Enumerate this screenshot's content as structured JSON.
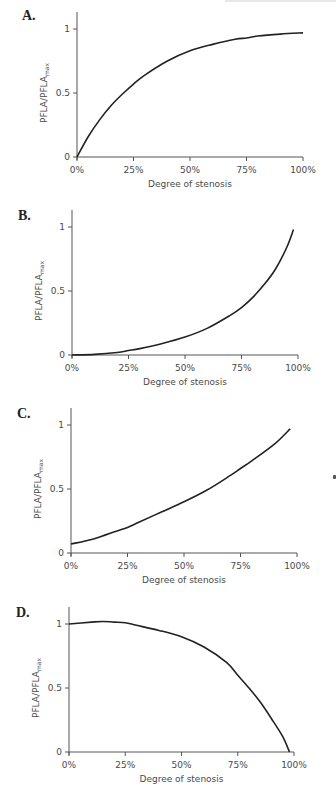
{
  "chart_data": [
    {
      "id": "A",
      "panel_label": "A.",
      "type": "line",
      "title": "",
      "xlabel": "Degree of stenosis",
      "ylabel": "PFLA/PFLA",
      "ylabel_sub": "max",
      "x_ticks": [
        "0%",
        "25%",
        "50%",
        "75%",
        "100%"
      ],
      "y_ticks": [
        "0",
        "0.5",
        "1"
      ],
      "xlim": [
        0,
        100
      ],
      "ylim": [
        0,
        1.15
      ],
      "grid": false,
      "x": [
        0,
        5,
        10,
        15,
        20,
        25,
        30,
        40,
        50,
        60,
        70,
        75,
        80,
        90,
        100
      ],
      "values": [
        0,
        0.16,
        0.29,
        0.4,
        0.49,
        0.57,
        0.64,
        0.75,
        0.83,
        0.88,
        0.92,
        0.93,
        0.945,
        0.96,
        0.97
      ]
    },
    {
      "id": "B",
      "panel_label": "B.",
      "type": "line",
      "title": "",
      "xlabel": "Degree of stenosis",
      "ylabel": "PFLA/PFLA",
      "ylabel_sub": "max",
      "x_ticks": [
        "0%",
        "25%",
        "50%",
        "75%",
        "100%"
      ],
      "y_ticks": [
        "0",
        "0.5",
        "1"
      ],
      "xlim": [
        0,
        100
      ],
      "ylim": [
        0,
        1.15
      ],
      "grid": false,
      "x": [
        0,
        10,
        20,
        25,
        30,
        40,
        50,
        60,
        70,
        75,
        80,
        85,
        90,
        95,
        98
      ],
      "values": [
        0,
        0.005,
        0.02,
        0.035,
        0.05,
        0.09,
        0.14,
        0.21,
        0.31,
        0.37,
        0.45,
        0.55,
        0.67,
        0.84,
        0.98
      ]
    },
    {
      "id": "C",
      "panel_label": "C.",
      "type": "line",
      "title": "",
      "xlabel": "Degree of stenosis",
      "ylabel": "PFLA/PFLA",
      "ylabel_sub": "max",
      "x_ticks": [
        "0%",
        "25%",
        "50%",
        "75%",
        "100%"
      ],
      "y_ticks": [
        "0",
        "0.5",
        "1"
      ],
      "xlim": [
        0,
        100
      ],
      "ylim": [
        0,
        1.15
      ],
      "grid": false,
      "x": [
        0,
        10,
        20,
        25,
        30,
        40,
        50,
        60,
        70,
        75,
        80,
        90,
        97
      ],
      "values": [
        0.07,
        0.11,
        0.17,
        0.2,
        0.24,
        0.32,
        0.4,
        0.49,
        0.6,
        0.66,
        0.72,
        0.85,
        0.97
      ]
    },
    {
      "id": "D",
      "panel_label": "D.",
      "type": "line",
      "title": "",
      "xlabel": "Degree of stenosis",
      "ylabel": "PFLA/PFLA",
      "ylabel_sub": "max",
      "x_ticks": [
        "0%",
        "25%",
        "50%",
        "75%",
        "100%"
      ],
      "y_ticks": [
        "0",
        "0.5",
        "1"
      ],
      "xlim": [
        0,
        100
      ],
      "ylim": [
        0,
        1.15
      ],
      "grid": false,
      "x": [
        0,
        10,
        15,
        20,
        25,
        30,
        40,
        50,
        60,
        70,
        75,
        80,
        85,
        90,
        95,
        98
      ],
      "values": [
        1.0,
        1.015,
        1.02,
        1.015,
        1.01,
        0.99,
        0.95,
        0.9,
        0.82,
        0.7,
        0.6,
        0.5,
        0.39,
        0.26,
        0.12,
        0.0
      ]
    }
  ],
  "layout": [
    {
      "top": 0,
      "letter_x": 22,
      "letter_y": 8,
      "ax_x0": 77,
      "ax_x1": 303,
      "ax_y0": 157,
      "ax_y1": 29,
      "ax_top": 12
    },
    {
      "top": 0,
      "letter_x": 18,
      "letter_y": 208,
      "ax_x0": 72,
      "ax_x1": 298,
      "ax_y0": 355,
      "ax_y1": 227,
      "ax_top": 210
    },
    {
      "top": 0,
      "letter_x": 17,
      "letter_y": 406,
      "ax_x0": 71,
      "ax_x1": 297,
      "ax_y0": 553,
      "ax_y1": 425,
      "ax_top": 408
    },
    {
      "top": 0,
      "letter_x": 16,
      "letter_y": 605,
      "ax_x0": 69,
      "ax_x1": 294,
      "ax_y0": 752,
      "ax_y1": 624,
      "ax_top": 607
    }
  ]
}
